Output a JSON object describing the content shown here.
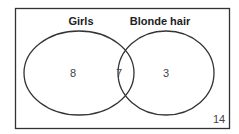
{
  "diagram": {
    "type": "venn",
    "sets": [
      {
        "label": "Girls",
        "only_count": "8"
      },
      {
        "label": "Blonde hair",
        "only_count": "3"
      }
    ],
    "intersection_count": "7",
    "outside_count": "14"
  }
}
